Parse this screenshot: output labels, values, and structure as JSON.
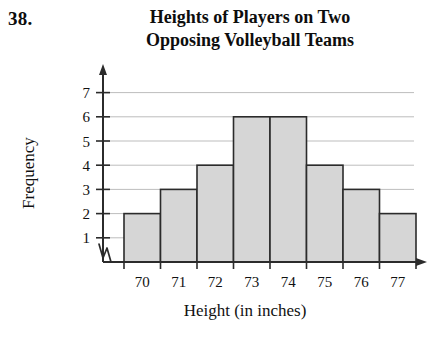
{
  "problem": {
    "number": "38."
  },
  "chart_title": {
    "line1": "Heights of Players on Two",
    "line2": "Opposing Volleyball Teams"
  },
  "axes": {
    "y_title": "Frequency",
    "x_title": "Height (in inches)"
  },
  "colors": {
    "bar_fill": "#d6d6d6",
    "bar_edge": "#2b2b2b",
    "axis": "#2b2b2b",
    "gridline": "#bdbdbd",
    "text": "#111111"
  },
  "chart_data": {
    "type": "bar",
    "title": "Heights of Players on Two Opposing Volleyball Teams",
    "xlabel": "Height (in inches)",
    "ylabel": "Frequency",
    "categories": [
      "70",
      "71",
      "72",
      "73",
      "74",
      "75",
      "76",
      "77"
    ],
    "values": [
      2,
      3,
      4,
      6,
      6,
      4,
      3,
      2
    ],
    "ylim": [
      0,
      7.6
    ],
    "yticks": [
      1,
      2,
      3,
      4,
      5,
      6,
      7
    ],
    "ytick_labels": [
      "1",
      "2",
      "3",
      "4",
      "5",
      "6",
      "7"
    ],
    "xtick_labels": [
      "70",
      "71",
      "72",
      "73",
      "74",
      "75",
      "76",
      "77"
    ],
    "grid": true,
    "grid_axis": "y",
    "legend": "none",
    "axis_break": "y-axis break at origin"
  }
}
